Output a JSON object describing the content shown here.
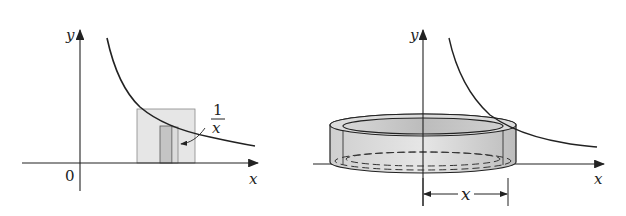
{
  "left_panel": {
    "y_axis_label": "y",
    "x_axis_label": "x",
    "origin_label": "0",
    "curve_label_numerator": "1",
    "curve_label_denominator": "x",
    "curve": "y = 1/x",
    "colors": {
      "stroke": "#222222",
      "shade_light": "#e4e4e4",
      "shade_dark": "#c6c6c6"
    }
  },
  "right_panel": {
    "y_axis_label": "y",
    "x_axis_label": "x",
    "radius_label": "x",
    "shape": "cylindrical shell",
    "colors": {
      "stroke": "#222222",
      "shell_fill": "#d6d6d6",
      "shell_inner": "#c8c8c8"
    }
  }
}
